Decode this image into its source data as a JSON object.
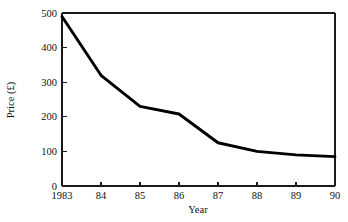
{
  "chart_data": {
    "type": "line",
    "title": "",
    "subtitle": "",
    "xlabel": "Year",
    "ylabel": "Price (£)",
    "x": [
      1983,
      1984,
      1985,
      1986,
      1987,
      1988,
      1989,
      1990
    ],
    "xtick_labels": [
      "1983",
      "84",
      "85",
      "86",
      "87",
      "88",
      "89",
      "90"
    ],
    "ytick_labels": [
      "0",
      "100",
      "200",
      "300",
      "400",
      "500"
    ],
    "ytick_values": [
      0,
      100,
      200,
      300,
      400,
      500
    ],
    "values": [
      490,
      320,
      230,
      208,
      125,
      100,
      90,
      85
    ],
    "series": [
      {
        "name": "Price",
        "values": [
          490,
          320,
          230,
          208,
          125,
          100,
          90,
          85
        ],
        "color": "#000000"
      }
    ],
    "xlim": [
      1983,
      1990
    ],
    "ylim": [
      0,
      500
    ],
    "grid": false,
    "legend": false,
    "legend_position": "none"
  },
  "style": {
    "line_color": "#000000",
    "axis_color": "#1a1a1a",
    "text_color": "#111111",
    "background": "#ffffff"
  }
}
